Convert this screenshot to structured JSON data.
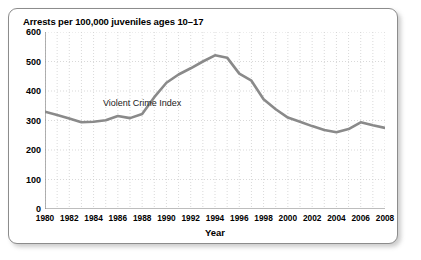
{
  "chart_data": {
    "type": "line",
    "title": "Arrests per 100,000 juveniles ages 10–17",
    "xlabel": "Year",
    "ylabel": "",
    "annotation": "Violent Crime Index",
    "xlim": [
      1980,
      2008
    ],
    "ylim": [
      0,
      600
    ],
    "grid": true,
    "legend": "none",
    "y_ticks": [
      600,
      500,
      400,
      300,
      200,
      100,
      0
    ],
    "x_ticks": [
      1980,
      1982,
      1984,
      1986,
      1988,
      1990,
      1992,
      1994,
      1996,
      1998,
      2000,
      2002,
      2004,
      2006,
      2008
    ],
    "x_minor_step": 1,
    "line_color": "#8a8a8a",
    "grid_color": "#c8c8c8",
    "axis_color": "#7d7d7d",
    "series": [
      {
        "name": "Violent Crime Index",
        "x": [
          1980,
          1981,
          1982,
          1983,
          1984,
          1985,
          1986,
          1987,
          1988,
          1989,
          1990,
          1991,
          1992,
          1993,
          1994,
          1995,
          1996,
          1997,
          1998,
          1999,
          2000,
          2001,
          2002,
          2003,
          2004,
          2005,
          2006,
          2007,
          2008
        ],
        "values": [
          330,
          319,
          307,
          294,
          296,
          301,
          315,
          308,
          322,
          379,
          428,
          456,
          477,
          500,
          521,
          513,
          459,
          435,
          372,
          338,
          310,
          296,
          281,
          268,
          260,
          271,
          294,
          284,
          275
        ]
      }
    ]
  },
  "figure": {
    "title": "Arrests per 100,000 juveniles ages 10–17",
    "x_axis_title": "Year",
    "annotation_label": "Violent Crime Index"
  }
}
